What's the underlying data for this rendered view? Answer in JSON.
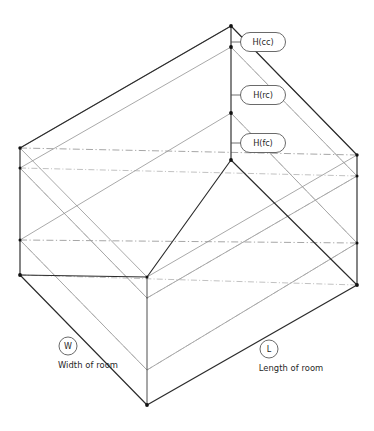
{
  "diagram": {
    "type": "isometric-room-box",
    "background_color": "#ffffff",
    "line_color": "#2b2b2b",
    "centerline_color": "#8f8f8f"
  },
  "height_callouts": [
    {
      "id": "cc",
      "label": "H(cc)",
      "meaning": "ceiling cavity height",
      "anchor_y": 42
    },
    {
      "id": "rc",
      "label": "H(rc)",
      "meaning": "room cavity height",
      "anchor_y": 95
    },
    {
      "id": "fc",
      "label": "H(fc)",
      "meaning": "floor cavity height",
      "anchor_y": 143
    }
  ],
  "dimension_callouts": [
    {
      "id": "W",
      "marker": "W",
      "caption": "Width of room"
    },
    {
      "id": "L",
      "marker": "L",
      "caption": "Length of room"
    }
  ]
}
